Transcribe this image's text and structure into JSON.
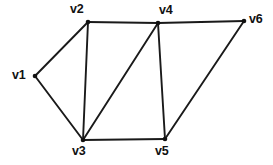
{
  "figure": {
    "type": "undirected-graph-diagram",
    "width": 273,
    "height": 165,
    "background_color": "#ffffff",
    "edge_color": "#1a1a1a",
    "vertex_color": "#111111",
    "label_color": "#111111"
  },
  "chart_data": {
    "type": "diagram",
    "title": "",
    "graph_kind": "undirected simple graph",
    "node_count": 6,
    "edge_count": 9,
    "nodes": [
      {
        "id": "v1",
        "label": "v1",
        "x": 35,
        "y": 76,
        "label_x": 12,
        "label_y": 69,
        "label_position": "left"
      },
      {
        "id": "v2",
        "label": "v2",
        "x": 88,
        "y": 22,
        "label_x": 70,
        "label_y": 3,
        "label_position": "above-left"
      },
      {
        "id": "v3",
        "label": "v3",
        "x": 83,
        "y": 140,
        "label_x": 72,
        "label_y": 145,
        "label_position": "below"
      },
      {
        "id": "v4",
        "label": "v4",
        "x": 158,
        "y": 23,
        "label_x": 159,
        "label_y": 4,
        "label_position": "above-right"
      },
      {
        "id": "v5",
        "label": "v5",
        "x": 165,
        "y": 139,
        "label_x": 155,
        "label_y": 145,
        "label_position": "below"
      },
      {
        "id": "v6",
        "label": "v6",
        "x": 244,
        "y": 21,
        "label_x": 249,
        "label_y": 13,
        "label_position": "right"
      }
    ],
    "edges": [
      {
        "from": "v1",
        "to": "v2"
      },
      {
        "from": "v1",
        "to": "v3"
      },
      {
        "from": "v2",
        "to": "v3"
      },
      {
        "from": "v2",
        "to": "v4"
      },
      {
        "from": "v3",
        "to": "v4"
      },
      {
        "from": "v3",
        "to": "v5"
      },
      {
        "from": "v4",
        "to": "v5"
      },
      {
        "from": "v4",
        "to": "v6"
      },
      {
        "from": "v5",
        "to": "v6"
      }
    ]
  }
}
